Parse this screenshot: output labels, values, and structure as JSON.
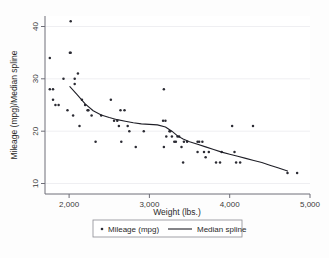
{
  "chart_data": {
    "type": "scatter",
    "title": "",
    "xlabel": "Weight (lbs.)",
    "ylabel": "Mileage (mpg)/Median spline",
    "xlim": [
      1700,
      5000
    ],
    "ylim": [
      8,
      42
    ],
    "xticks": [
      2000,
      3000,
      4000,
      5000
    ],
    "xtick_labels": [
      "2,000",
      "3,000",
      "4,000",
      "5,000"
    ],
    "yticks": [
      10,
      20,
      30,
      40
    ],
    "ytick_labels": [
      "10",
      "20",
      "30",
      "40"
    ],
    "grid": true,
    "legend_position": "bottom",
    "series": [
      {
        "name": "Mileage (mpg)",
        "type": "scatter",
        "marker": "dot",
        "color": "#2b2b33",
        "points": [
          [
            1760,
            28
          ],
          [
            1800,
            28
          ],
          [
            1760,
            34
          ],
          [
            1800,
            26
          ],
          [
            1830,
            25
          ],
          [
            1870,
            25
          ],
          [
            1930,
            30
          ],
          [
            1980,
            24
          ],
          [
            2020,
            41
          ],
          [
            2020,
            35
          ],
          [
            2010,
            35
          ],
          [
            2050,
            23
          ],
          [
            2070,
            29
          ],
          [
            2070,
            30
          ],
          [
            2110,
            31
          ],
          [
            2130,
            21
          ],
          [
            2160,
            26
          ],
          [
            2200,
            25
          ],
          [
            2230,
            24
          ],
          [
            2240,
            24
          ],
          [
            2280,
            23
          ],
          [
            2330,
            18
          ],
          [
            2400,
            23
          ],
          [
            2520,
            26
          ],
          [
            2560,
            22
          ],
          [
            2600,
            22
          ],
          [
            2620,
            21
          ],
          [
            2640,
            24
          ],
          [
            2690,
            24
          ],
          [
            2650,
            18
          ],
          [
            2730,
            21
          ],
          [
            2750,
            20
          ],
          [
            2830,
            17
          ],
          [
            2930,
            20
          ],
          [
            3180,
            28
          ],
          [
            3170,
            22
          ],
          [
            3200,
            22
          ],
          [
            3210,
            19
          ],
          [
            3180,
            17
          ],
          [
            3250,
            20
          ],
          [
            3260,
            20
          ],
          [
            3280,
            19
          ],
          [
            3310,
            18
          ],
          [
            3330,
            18
          ],
          [
            3350,
            19
          ],
          [
            3370,
            19
          ],
          [
            3400,
            17
          ],
          [
            3420,
            14
          ],
          [
            3430,
            18
          ],
          [
            3470,
            18
          ],
          [
            3600,
            18
          ],
          [
            3620,
            18
          ],
          [
            3660,
            18
          ],
          [
            3600,
            16
          ],
          [
            3680,
            16
          ],
          [
            3700,
            15
          ],
          [
            3740,
            16
          ],
          [
            3830,
            14
          ],
          [
            3880,
            14
          ],
          [
            3900,
            16
          ],
          [
            4030,
            21
          ],
          [
            4060,
            16
          ],
          [
            4080,
            14
          ],
          [
            4130,
            14
          ],
          [
            4290,
            21
          ],
          [
            4720,
            12
          ],
          [
            4840,
            12
          ]
        ]
      },
      {
        "name": "Median spline",
        "type": "line",
        "color": "#1f1f27",
        "points": [
          [
            2010,
            28.5
          ],
          [
            2100,
            27.0
          ],
          [
            2200,
            25.2
          ],
          [
            2300,
            23.9
          ],
          [
            2400,
            23.1
          ],
          [
            2500,
            22.6
          ],
          [
            2600,
            22.2
          ],
          [
            2700,
            21.9
          ],
          [
            2800,
            21.6
          ],
          [
            2900,
            21.4
          ],
          [
            3000,
            21.3
          ],
          [
            3100,
            21.2
          ],
          [
            3200,
            20.8
          ],
          [
            3280,
            20.0
          ],
          [
            3350,
            19.1
          ],
          [
            3420,
            18.5
          ],
          [
            3500,
            18.0
          ],
          [
            3600,
            17.5
          ],
          [
            3700,
            17.0
          ],
          [
            3800,
            16.5
          ],
          [
            3900,
            16.0
          ],
          [
            4000,
            15.6
          ],
          [
            4100,
            15.2
          ],
          [
            4200,
            14.8
          ],
          [
            4300,
            14.4
          ],
          [
            4400,
            14.0
          ],
          [
            4500,
            13.5
          ],
          [
            4600,
            13.0
          ],
          [
            4720,
            12.4
          ]
        ]
      }
    ]
  },
  "legend": {
    "items": [
      {
        "label": "Mileage (mpg)",
        "marker": "dot"
      },
      {
        "label": "Median spline",
        "marker": "line"
      }
    ]
  }
}
